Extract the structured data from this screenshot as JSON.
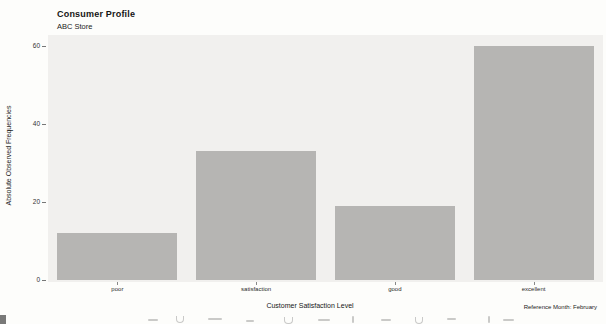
{
  "header": {
    "title": "Consumer Profile",
    "subtitle": "ABC Store"
  },
  "footer": {
    "reference_note": "Reference Month: February"
  },
  "chart_data": {
    "type": "bar",
    "title": "Consumer Profile",
    "subtitle": "ABC Store",
    "categories": [
      "poor",
      "satisfaction",
      "good",
      "excellent"
    ],
    "values": [
      12,
      33,
      19,
      60
    ],
    "xlabel": "Customer Satisfaction Level",
    "ylabel": "Absolute Observed Frequencies",
    "ylim": [
      0,
      60
    ],
    "yticks": [
      0,
      20,
      40,
      60
    ],
    "grid": false,
    "legend": "none",
    "bar_color": "#b6b5b3",
    "panel_color": "#f1f0ee",
    "annotation": "Reference Month: February"
  }
}
